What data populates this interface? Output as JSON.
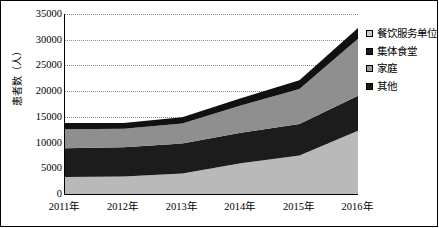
{
  "chart_data": {
    "type": "area",
    "stacked": true,
    "title": "",
    "xlabel": "",
    "ylabel": "患者数（人）",
    "categories": [
      "2011年",
      "2012年",
      "2013年",
      "2014年",
      "2015年",
      "2016年"
    ],
    "ylim": [
      0,
      35000
    ],
    "ytick_labels": [
      "0",
      "5000",
      "10000",
      "15000",
      "20000",
      "25000",
      "30000",
      "35000"
    ],
    "ytick_values": [
      0,
      5000,
      10000,
      15000,
      20000,
      25000,
      30000,
      35000
    ],
    "grid": true,
    "grid_style": "dotted-horizontal",
    "legend_position": "right",
    "stack_order_bottom_to_top": [
      "家庭",
      "其他",
      "集体食堂",
      "餐饮服务单位"
    ],
    "series": [
      {
        "name": "餐饮服务单位",
        "color": "#111111",
        "swatch": "light-gray",
        "values": [
          1200,
          1100,
          1200,
          1400,
          1700,
          2100
        ]
      },
      {
        "name": "集体食堂",
        "color": "#8f8f8f",
        "swatch": "black",
        "values": [
          3700,
          3600,
          3900,
          5300,
          6800,
          11100
        ]
      },
      {
        "name": "家庭",
        "color": "#b9b9b9",
        "swatch": "gray",
        "values": [
          3300,
          3400,
          4000,
          6000,
          7500,
          12300
        ]
      },
      {
        "name": "其他",
        "color": "#1c1c1c",
        "swatch": "black",
        "values": [
          5600,
          5700,
          5800,
          5900,
          6100,
          6800
        ]
      }
    ],
    "totals": [
      13800,
      13800,
      14900,
      18600,
      22100,
      32300
    ]
  },
  "legend": {
    "items": [
      {
        "label": "餐饮服务单位",
        "swatch_color": "#c9c9c9"
      },
      {
        "label": "集体食堂",
        "swatch_color": "#1a1a1a"
      },
      {
        "label": "家庭",
        "swatch_color": "#9a9a9a"
      },
      {
        "label": "其他",
        "swatch_color": "#1a1a1a"
      }
    ]
  },
  "axis": {
    "y_title": "患者数（人）"
  }
}
